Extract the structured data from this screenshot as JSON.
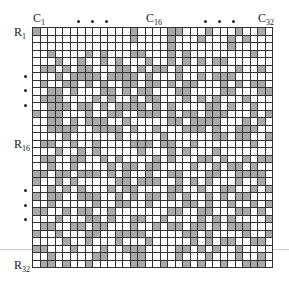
{
  "figure": {
    "col_labels": [
      {
        "text": "C",
        "sub": "1",
        "x": 33
      },
      {
        "text": "C",
        "sub": "16",
        "x": 146
      },
      {
        "text": "C",
        "sub": "32",
        "x": 258
      }
    ],
    "row_labels": [
      {
        "text": "R",
        "sub": "1",
        "y": 26
      },
      {
        "text": "R",
        "sub": "16",
        "y": 138
      },
      {
        "text": "R",
        "sub": "32",
        "y": 259
      }
    ],
    "col_ellipsis_x": [
      77,
      91,
      105,
      204,
      218,
      232
    ],
    "row_ellipsis_y": [
      75,
      89,
      104,
      189,
      204,
      218
    ],
    "rows": 32,
    "cols": 32,
    "fill_color": "#a9a9a9",
    "empty_color": "#ffffff",
    "matrix": [
      "10000000000001000011000100010010",
      "00000000000001000010001000101000",
      "00000000000000000010000000100000",
      "00100001010001100010100000000100",
      "00010010010100010010101011000000",
      "01101011000110101101000000010010",
      "00010111101111010001001011100000",
      "01001101010011011010110001010110",
      "00110100011010110001100001100011",
      "01110000101001011000101010001000",
      "00111011010111101010000110100100",
      "10110001001100111010110111000101",
      "00110101110010000011011110001010",
      "00111100111101001000111010011100",
      "00001000000100000100000011011001",
      "01100100100001110110010000000100",
      "00010010100000100010100010000000",
      "01100110010100001010001101001011",
      "00100100001011011000010010110100",
      "11011011101010010011000110011110",
      "10010100000110111001010100010010",
      "00101010001011000011001001100101",
      "10110011100101011010100101011000",
      "00100000100110010000110100100101",
      "11001011001000000011001100011010",
      "00010001101001100100001010100001",
      "01100110110001001011011010111000",
      "10010001100111100000110100001001",
      "00001001000100010000010101100110",
      "11000100010011100001101010010000",
      "00100000110001100001000100010010",
      "01101001000001100100101001001110"
    ]
  }
}
